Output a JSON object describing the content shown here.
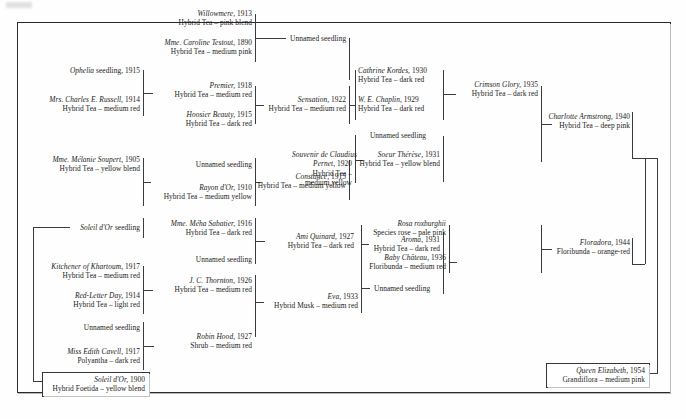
{
  "diagram": {
    "type": "pedigree",
    "frame_color": "#2a2a2e",
    "line_color": "#3a3a3f",
    "text_color": "#1b1b20"
  },
  "nodes": {
    "willowmere": {
      "name": "Willowmere,",
      "year": "1913",
      "classification": "Hybrid Tea – pink blend"
    },
    "mme_caroline_testout": {
      "name": "Mme. Caroline Testout,",
      "year": "1890",
      "classification": "Hybrid Tea – medium pink"
    },
    "unnamed_seedling_top": {
      "name": "Unnamed seedling",
      "year": "",
      "classification": ""
    },
    "ophelia_seedling": {
      "name": "Ophelia",
      "year": "",
      "classification": "",
      "suffix": "seedling, 1915"
    },
    "mrs_charles_e_russell": {
      "name": "Mrs. Charles E. Russell,",
      "year": "1914",
      "classification": "Hybrid Tea – medium red"
    },
    "premier": {
      "name": "Premier,",
      "year": "1918",
      "classification": "Hybrid Tea – medium red"
    },
    "hoosier_beauty": {
      "name": "Hoosier Beauty,",
      "year": "1915",
      "classification": "Hybrid Tea – dark red"
    },
    "sensation": {
      "name": "Sensation,",
      "year": "1922",
      "classification": "Hybrid Tea – medium red"
    },
    "cathrine_kordes": {
      "name": "Cathrine Kordes,",
      "year": "1930",
      "classification": "Hybrid Tea – dark red"
    },
    "w_e_chaplin": {
      "name": "W. E. Chaplin,",
      "year": "1929",
      "classification": "Hybrid Tea – dark red"
    },
    "crimson_glory": {
      "name": "Crimson Glory,",
      "year": "1935",
      "classification": "Hybrid Tea – dark red"
    },
    "charlotte_armstrong": {
      "name": "Charlotte Armstrong,",
      "year": "1940",
      "classification": "Hybrid Tea – deep pink"
    },
    "unnamed_seedling_sdc": {
      "name": "Unnamed seedling",
      "year": "",
      "classification": ""
    },
    "souvenir_de_claudius_pernet": {
      "name": "Souvenir de Claudius",
      "name2": "Pernet,",
      "year": "1920",
      "classification": "Hybrid Tea –",
      "classification2": "medium yellow"
    },
    "soeur_therese": {
      "name": "Soeur Thérèse,",
      "year": "1931",
      "classification": "Hybrid Tea – yellow blend"
    },
    "mme_melanie_soupert": {
      "name": "Mme. Mélanie Soupert,",
      "year": "1905",
      "classification": "Hybrid Tea – yellow blend"
    },
    "unnamed_seedling_rayon": {
      "name": "Unnamed seedling",
      "year": "",
      "classification": ""
    },
    "rayon_dor": {
      "name": "Rayon d'Or,",
      "year": "1910",
      "classification": "Hybrid Tea – medium yellow"
    },
    "constance": {
      "name": "Constance,",
      "year": "1915",
      "classification": "Hybrid Tea – medium yellow"
    },
    "soleil_dor_seedling": {
      "name": "Soleil d'Or",
      "year": "",
      "classification": "",
      "suffix": "seedling"
    },
    "mme_meha_sabatier": {
      "name": "Mme. Méha Sabatier,",
      "year": "1916",
      "classification": "Hybrid Tea – dark red"
    },
    "unnamed_seedling_ami": {
      "name": "Unnamed seedling",
      "year": "",
      "classification": ""
    },
    "ami_quinard": {
      "name": "Ami Quinard,",
      "year": "1927",
      "classification": "Hybrid Tea – dark red"
    },
    "aroma": {
      "name": "Aroma,",
      "year": "1931",
      "classification": "Hybrid Tea – dark red"
    },
    "rosa_roxburghii": {
      "name": "Rosa roxburghii",
      "year": "",
      "classification": "Species rose – pale pink"
    },
    "baby_chateau": {
      "name": "Baby Château,",
      "year": "1936",
      "classification": "Floribunda – medium red"
    },
    "floradora": {
      "name": "Floradora,",
      "year": "1944",
      "classification": "Floribunda – orange-red"
    },
    "kitchener_of_khartoum": {
      "name": "Kitchener of Khartoum,",
      "year": "1917",
      "classification": "Hybrid Tea – medium red"
    },
    "red_letter_day": {
      "name": "Red-Letter Day,",
      "year": "1914",
      "classification": "Hybrid Tea – light red"
    },
    "j_c_thornton": {
      "name": "J. C. Thornton,",
      "year": "1926",
      "classification": "Hybrid Tea – medium red"
    },
    "unnamed_seedling_robin": {
      "name": "Unnamed seedling",
      "year": "",
      "classification": ""
    },
    "miss_edith_cavell": {
      "name": "Miss Edith Cavell,",
      "year": "1917",
      "classification": "Polyantha – dark red"
    },
    "robin_hood": {
      "name": "Robin Hood,",
      "year": "1927",
      "classification": "Shrub – medium red"
    },
    "eva": {
      "name": "Eva,",
      "year": "1933",
      "classification": "Hybrid Musk – medium red"
    },
    "unnamed_seedling_aroma": {
      "name": "Unnamed seedling",
      "year": "",
      "classification": ""
    },
    "soleil_dor": {
      "name": "Soleil d'Or,",
      "year": "1900",
      "classification": "Hybrid Foetida – yellow blend"
    },
    "queen_elizabeth": {
      "name": "Queen Elizabeth,",
      "year": "1954",
      "classification": "Grandiflora – medium pink"
    }
  }
}
